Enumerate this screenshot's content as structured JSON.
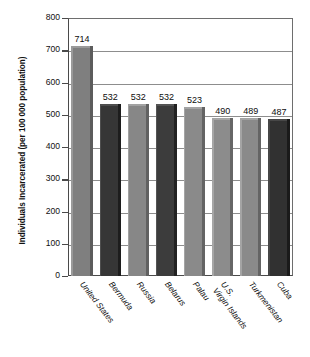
{
  "chart_data": {
    "type": "bar",
    "title": "",
    "xlabel": "",
    "ylabel": "Individuals Incarcerated (per 100 000 population)",
    "categories": [
      "United States",
      "Bermuda",
      "Russia",
      "Belarus",
      "Palau",
      "U.S. Virgin Islands",
      "Turkmenistan",
      "Cuba"
    ],
    "category_lines": [
      [
        "United States"
      ],
      [
        "Bermuda"
      ],
      [
        "Russia"
      ],
      [
        "Belarus"
      ],
      [
        "Palau"
      ],
      [
        "U.S.",
        "Virgin Islands"
      ],
      [
        "Turkmenistan"
      ],
      [
        "Cuba"
      ]
    ],
    "values": [
      714,
      532,
      532,
      532,
      523,
      490,
      489,
      487
    ],
    "value_labels": [
      "714",
      "532",
      "532",
      "532",
      "523",
      "490",
      "489",
      "487"
    ],
    "ylim": [
      0,
      800
    ],
    "ytick_values": [
      0,
      100,
      200,
      300,
      400,
      500,
      600,
      700,
      800
    ],
    "ytick_labels": [
      "0",
      "100",
      "200",
      "300",
      "400",
      "500",
      "600",
      "700",
      "800"
    ],
    "grid": true,
    "grid_axis": "y",
    "legend": false,
    "bar_colors": [
      "#7f7f7f",
      "#363636",
      "#878787",
      "#3c3c3c",
      "#8a8a8a",
      "#8c8c8c",
      "#8a8a8a",
      "#313131"
    ],
    "bar_shadow_colors": [
      "#5c5c5c",
      "#1d1d1d",
      "#616161",
      "#222222",
      "#646464",
      "#666666",
      "#646464",
      "#1a1a1a"
    ],
    "bar_highlight_colors": [
      "#9a9a9a",
      "#4e4e4e",
      "#a2a2a2",
      "#545454",
      "#a4a4a4",
      "#a6a6a6",
      "#a4a4a4",
      "#474747"
    ],
    "axis_color": "#4a4a4a",
    "grid_color": "#8d8d8d",
    "background_color": "#ffffff",
    "text_color": "#111111"
  }
}
